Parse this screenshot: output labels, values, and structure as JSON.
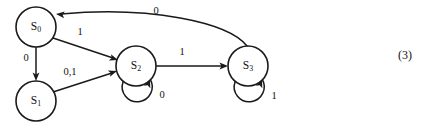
{
  "figure": {
    "caption_number": "(3)",
    "caption_x": 398,
    "caption_y": 48,
    "background_color": "#ffffff",
    "stroke_color": "#1a1a1a",
    "text_color": "#111111",
    "width": 434,
    "height": 125
  },
  "diagram": {
    "type": "state-transition-diagram",
    "node_radius": 20,
    "nodes": [
      {
        "id": "s0",
        "label": "S",
        "subscript": "0",
        "cx": 36,
        "cy": 27,
        "r": 20
      },
      {
        "id": "s1",
        "label": "S",
        "subscript": "1",
        "cx": 36,
        "cy": 101,
        "r": 20
      },
      {
        "id": "s2",
        "label": "S",
        "subscript": "2",
        "cx": 136,
        "cy": 66,
        "r": 20
      },
      {
        "id": "s3",
        "label": "S",
        "subscript": "3",
        "cx": 248,
        "cy": 66,
        "r": 20
      }
    ],
    "edges": [
      {
        "id": "e-s0-s1",
        "from": "s0",
        "to": "s1",
        "label": "0",
        "label_x": 26,
        "label_y": 59,
        "kind": "straight",
        "path": "M 36 47 L 36 77",
        "arrow_x": 36,
        "arrow_y": 81,
        "arrow_angle": 90
      },
      {
        "id": "e-s0-s2",
        "from": "s0",
        "to": "s2",
        "label": "1",
        "label_x": 80,
        "label_y": 33,
        "kind": "straight",
        "path": "M 53 38 L 113 58",
        "arrow_x": 118,
        "arrow_y": 60,
        "arrow_angle": 18
      },
      {
        "id": "e-s1-s2",
        "from": "s1",
        "to": "s2",
        "label": "0,1",
        "label_x": 70,
        "label_y": 73,
        "kind": "straight",
        "path": "M 53 92 L 112 73",
        "arrow_x": 117,
        "arrow_y": 71,
        "arrow_angle": -18
      },
      {
        "id": "e-s2-s3",
        "from": "s2",
        "to": "s3",
        "label": "1",
        "label_x": 182,
        "label_y": 53,
        "kind": "straight",
        "path": "M 156 66 L 223 66",
        "arrow_x": 228,
        "arrow_y": 66,
        "arrow_angle": 0
      },
      {
        "id": "e-s3-s0",
        "from": "s3",
        "to": "s0",
        "label": "0",
        "label_x": 156,
        "label_y": 12,
        "kind": "curved",
        "path": "M 247 46 C 228 22 150 6 61 14",
        "arrow_x": 56,
        "arrow_y": 14,
        "arrow_angle": 186
      },
      {
        "id": "e-s2-s2-loop",
        "from": "s2",
        "to": "s2",
        "label": "0",
        "label_x": 162,
        "label_y": 96,
        "kind": "self-loop",
        "path": "M 123 82 A 15 15 0 1 0 150 79",
        "arrow_x": 150,
        "arrow_y": 79,
        "arrow_angle": -70
      },
      {
        "id": "e-s3-s3-loop",
        "from": "s3",
        "to": "s3",
        "label": "1",
        "label_x": 274,
        "label_y": 97,
        "kind": "self-loop",
        "path": "M 235 82 A 15 15 0 1 0 262 79",
        "arrow_x": 262,
        "arrow_y": 79,
        "arrow_angle": -70
      }
    ]
  }
}
